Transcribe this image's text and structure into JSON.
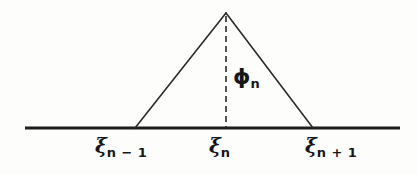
{
  "figure": {
    "kind": "line-diagram",
    "background_color": "#fdfdfc",
    "ink_color": "#171717",
    "line_color": "#2b2b2b"
  },
  "axis": {
    "name": "baseline",
    "x_start": 25,
    "x_end": 400,
    "y": 128,
    "stroke_width": 3
  },
  "hat": {
    "apex": {
      "x": 226,
      "y": 13
    },
    "left_vertex": {
      "x": 135,
      "y": 128
    },
    "right_vertex": {
      "x": 313,
      "y": 128
    },
    "stroke_width": 1.6
  },
  "dashed_line": {
    "x": 226,
    "y_top": 16,
    "y_bottom": 127,
    "dash": 6,
    "gap": 4,
    "stroke_width": 1.6
  },
  "labels": {
    "xi_left": {
      "symbol": "ξ",
      "subscript": "n − 1"
    },
    "xi_mid": {
      "symbol": "ξ",
      "subscript": "n"
    },
    "xi_right": {
      "symbol": "ξ",
      "subscript": "n + 1"
    },
    "phi": {
      "symbol": "ϕ",
      "subscript": "n"
    }
  }
}
